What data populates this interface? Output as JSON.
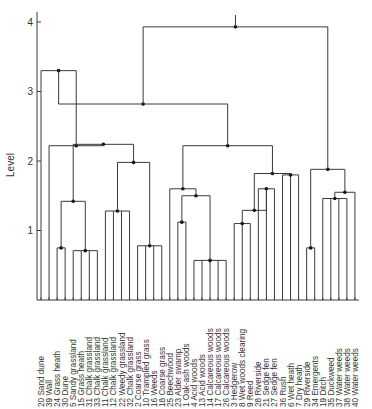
{
  "chart_data": {
    "type": "dendrogram",
    "title": "",
    "ylabel": "Level",
    "xlabel": "",
    "ylim": [
      0,
      4.2
    ],
    "yticks": [
      1,
      2,
      3,
      4
    ],
    "grid": false,
    "leaves": [
      {
        "id": 20,
        "label": "Sand dune"
      },
      {
        "id": 39,
        "label": "Wall"
      },
      {
        "id": 24,
        "label": "Grass heath"
      },
      {
        "id": 30,
        "label": "Dune"
      },
      {
        "id": 5,
        "label": "Sandy grassland"
      },
      {
        "id": 15,
        "label": "Grass heath"
      },
      {
        "id": 31,
        "label": "Chalk grassland"
      },
      {
        "id": 33,
        "label": "Chalk grassland"
      },
      {
        "id": 11,
        "label": "Chalk grassland"
      },
      {
        "id": 12,
        "label": "Chalk grassland"
      },
      {
        "id": 22,
        "label": "Weedy grassland"
      },
      {
        "id": 32,
        "label": "Chalk grassland"
      },
      {
        "id": 2,
        "label": "Coarse grass"
      },
      {
        "id": 10,
        "label": "Trampled grass"
      },
      {
        "id": 16,
        "label": "Weeds"
      },
      {
        "id": 18,
        "label": "Coarse grass"
      },
      {
        "id": 25,
        "label": "Beechwood"
      },
      {
        "id": 23,
        "label": "Alder swamp"
      },
      {
        "id": 1,
        "label": "Oak-ash woods"
      },
      {
        "id": 4,
        "label": "Acid woods"
      },
      {
        "id": 13,
        "label": "Acid woods"
      },
      {
        "id": 14,
        "label": "Calcareous woods"
      },
      {
        "id": 17,
        "label": "Calcareous woods"
      },
      {
        "id": 26,
        "label": "Calcareous woods"
      },
      {
        "id": 3,
        "label": "Hedgerow"
      },
      {
        "id": 8,
        "label": "Wet woods clearing"
      },
      {
        "id": 9,
        "label": "Reed"
      },
      {
        "id": 28,
        "label": "Riverside"
      },
      {
        "id": 21,
        "label": "Sedge fen"
      },
      {
        "id": 27,
        "label": "Sedge fen"
      },
      {
        "id": 36,
        "label": "Rush"
      },
      {
        "id": 6,
        "label": "Wet heath"
      },
      {
        "id": 7,
        "label": "Dry heath"
      },
      {
        "id": 29,
        "label": "Riverside"
      },
      {
        "id": 34,
        "label": "Emergents"
      },
      {
        "id": 19,
        "label": "Ditch"
      },
      {
        "id": 35,
        "label": "Duckweed"
      },
      {
        "id": 37,
        "label": "Water weeds"
      },
      {
        "id": 38,
        "label": "Water weeds"
      },
      {
        "id": 40,
        "label": "Water weeds"
      }
    ],
    "tree": {
      "h": 3.93,
      "stem": 4.1,
      "c": [
        {
          "h": 2.82,
          "c": [
            {
              "h": 3.3,
              "c": [
                {
                  "leaf": 0
                },
                {
                  "h": 2.22,
                  "c": [
                    {
                      "leaf": 1
                    },
                    {
                      "h": 2.24,
                      "c": [
                        {
                          "h": 1.42,
                          "c": [
                            {
                              "h": 0.75,
                              "c": [
                                {
                                  "leaf": 2
                                },
                                {
                                  "leaf": 3
                                }
                              ]
                            },
                            {
                              "h": 0.71,
                              "c": [
                                {
                                  "leaf": 4
                                },
                                {
                                  "leaf": 5
                                },
                                {
                                  "leaf": 6
                                },
                                {
                                  "leaf": 7
                                }
                              ]
                            }
                          ]
                        },
                        {
                          "h": 1.98,
                          "c": [
                            {
                              "h": 1.28,
                              "c": [
                                {
                                  "leaf": 8
                                },
                                {
                                  "leaf": 9
                                },
                                {
                                  "leaf": 10
                                },
                                {
                                  "leaf": 11
                                }
                              ]
                            },
                            {
                              "h": 0.78,
                              "c": [
                                {
                                  "leaf": 12
                                },
                                {
                                  "leaf": 13
                                },
                                {
                                  "leaf": 14
                                },
                                {
                                  "leaf": 15
                                }
                              ]
                            }
                          ]
                        }
                      ]
                    }
                  ]
                }
              ]
            },
            {
              "h": 2.22,
              "c": [
                {
                  "h": 1.6,
                  "c": [
                    {
                      "leaf": 16
                    },
                    {
                      "h": 1.5,
                      "c": [
                        {
                          "h": 1.12,
                          "c": [
                            {
                              "leaf": 17
                            },
                            {
                              "leaf": 18
                            }
                          ]
                        },
                        {
                          "h": 0.57,
                          "c": [
                            {
                              "leaf": 19
                            },
                            {
                              "leaf": 20
                            },
                            {
                              "leaf": 21
                            },
                            {
                              "leaf": 22
                            },
                            {
                              "leaf": 23
                            }
                          ]
                        }
                      ]
                    }
                  ]
                },
                {
                  "h": 1.82,
                  "c": [
                    {
                      "h": 1.29,
                      "c": [
                        {
                          "h": 1.1,
                          "c": [
                            {
                              "leaf": 24
                            },
                            {
                              "leaf": 25
                            },
                            {
                              "leaf": 26
                            }
                          ]
                        },
                        {
                          "h": 1.6,
                          "c": [
                            {
                              "leaf": 27
                            },
                            {
                              "leaf": 28
                            },
                            {
                              "leaf": 29
                            }
                          ]
                        }
                      ]
                    },
                    {
                      "h": 1.8,
                      "c": [
                        {
                          "leaf": 30
                        },
                        {
                          "leaf": 31
                        },
                        {
                          "leaf": 32
                        }
                      ]
                    }
                  ]
                }
              ]
            }
          ]
        },
        {
          "h": 1.88,
          "c": [
            {
              "h": 0.75,
              "c": [
                {
                  "leaf": 33
                },
                {
                  "leaf": 34
                }
              ]
            },
            {
              "h": 1.55,
              "c": [
                {
                  "h": 1.46,
                  "c": [
                    {
                      "leaf": 35
                    },
                    {
                      "leaf": 36
                    },
                    {
                      "leaf": 37
                    },
                    {
                      "leaf": 38
                    }
                  ]
                },
                {
                  "leaf": 39
                }
              ]
            }
          ]
        }
      ]
    }
  }
}
